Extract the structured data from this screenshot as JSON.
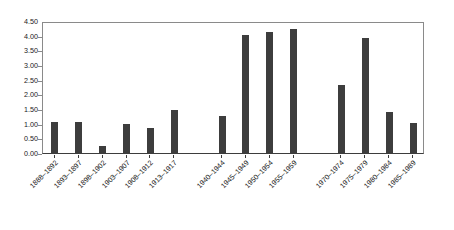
{
  "chart_data": {
    "type": "bar",
    "title": "",
    "subtitle": "",
    "xlabel": "",
    "ylabel": "",
    "legend": [],
    "legend_position": "none",
    "grid": false,
    "ylim": [
      0.0,
      4.5
    ],
    "ytick_labels": [
      "4.50",
      "4.00",
      "3.50",
      "3.00",
      "2.50",
      "2.00",
      "1.50",
      "1.00",
      "0.50",
      "0.00"
    ],
    "ytick_values": [
      4.5,
      4.0,
      3.5,
      3.0,
      2.5,
      2.0,
      1.5,
      1.0,
      0.5,
      0.0
    ],
    "categories": [
      "1888–1892",
      "1893–1897",
      "1898–1902",
      "1903–1907",
      "1908–1912",
      "1913–1917",
      "1940–1944",
      "1945–1949",
      "1950–1954",
      "1955–1959",
      "1970–1974",
      "1975–1979",
      "1980–1984",
      "1985–1989"
    ],
    "values": [
      1.05,
      1.06,
      0.25,
      1.0,
      0.85,
      1.47,
      1.25,
      4.03,
      4.12,
      4.22,
      2.32,
      3.92,
      1.41,
      1.02
    ],
    "slot_index": [
      0,
      1,
      2,
      3,
      4,
      5,
      7,
      8,
      9,
      10,
      12,
      13,
      14,
      15
    ],
    "slot_count": 16,
    "bar_color": "#3d3d3d",
    "plot_border_color": "#8a8a8a",
    "axis_color": "#3d3d3d",
    "background_color": "#ffffff"
  }
}
